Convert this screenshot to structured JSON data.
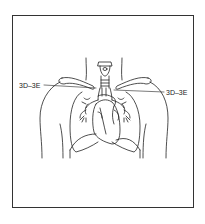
{
  "figure": {
    "type": "anatomical line drawing",
    "frame_color": "#333333",
    "stroke_color": "#222222",
    "background": "#ffffff"
  },
  "labels": {
    "left": {
      "text": "3D–3E",
      "points_to": "left subclavian region"
    },
    "right": {
      "text": "3D–3E",
      "points_to": "right subclavian region"
    }
  }
}
